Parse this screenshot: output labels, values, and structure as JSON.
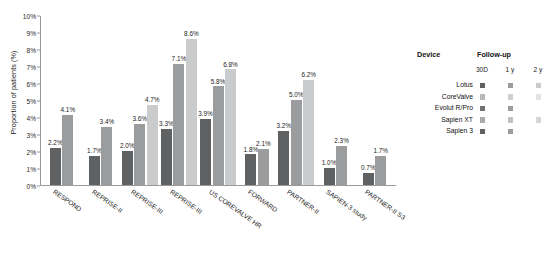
{
  "chart_data": {
    "type": "bar",
    "title": "",
    "xlabel": "",
    "ylabel": "Proportion of patients (%)",
    "ylim": [
      0,
      10
    ],
    "ytick_labels": [
      "0%",
      "1%",
      "2%",
      "3%",
      "4%",
      "5%",
      "6%",
      "7%",
      "8%",
      "9%",
      "10%"
    ],
    "ytick_values": [
      0,
      1,
      2,
      3,
      4,
      5,
      6,
      7,
      8,
      9,
      10
    ],
    "grid": false,
    "legend_position": "right",
    "series": [
      {
        "name": "30D",
        "color": "#5f6163"
      },
      {
        "name": "1 y",
        "color": "#9a9c9e"
      },
      {
        "name": "2 y",
        "color": "#c9cbcd"
      }
    ],
    "categories": [
      "RESPOND",
      "REPRISE-II",
      "REPRISE-III",
      "REPRISE-III",
      "US COREVALVE HR",
      "FORWARD",
      "PARTNER-II",
      "SAPIEN-3 study",
      "PARTNER-II S3"
    ],
    "groups": [
      {
        "category": "RESPOND",
        "bars": [
          {
            "series": "30D",
            "value": 2.2,
            "label": "2.2%"
          },
          {
            "series": "1 y",
            "value": 4.1,
            "label": "4.1%"
          }
        ]
      },
      {
        "category": "REPRISE-II",
        "bars": [
          {
            "series": "30D",
            "value": 1.7,
            "label": "1.7%"
          },
          {
            "series": "1 y",
            "value": 3.4,
            "label": "3.4%"
          }
        ]
      },
      {
        "category": "REPRISE-III",
        "bars": [
          {
            "series": "30D",
            "value": 2.0,
            "label": "2.0%"
          },
          {
            "series": "1 y",
            "value": 3.6,
            "label": "3.6%"
          },
          {
            "series": "2 y",
            "value": 4.7,
            "label": "4.7%"
          }
        ]
      },
      {
        "category": "REPRISE-III",
        "bars": [
          {
            "series": "30D",
            "value": 3.3,
            "label": "3.3%"
          },
          {
            "series": "1 y",
            "value": 7.1,
            "label": "7.1%"
          },
          {
            "series": "2 y",
            "value": 8.6,
            "label": "8.6%"
          }
        ]
      },
      {
        "category": "US COREVALVE HR",
        "bars": [
          {
            "series": "30D",
            "value": 3.9,
            "label": "3.9%"
          },
          {
            "series": "1 y",
            "value": 5.8,
            "label": "5.8%"
          },
          {
            "series": "2 y",
            "value": 6.8,
            "label": "6.8%"
          }
        ]
      },
      {
        "category": "FORWARD",
        "bars": [
          {
            "series": "30D",
            "value": 1.8,
            "label": "1.8%"
          },
          {
            "series": "1 y",
            "value": 2.1,
            "label": "2.1%"
          }
        ]
      },
      {
        "category": "PARTNER-II",
        "bars": [
          {
            "series": "30D",
            "value": 3.2,
            "label": "3.2%"
          },
          {
            "series": "1 y",
            "value": 5.0,
            "label": "5.0%"
          },
          {
            "series": "2 y",
            "value": 6.2,
            "label": "6.2%"
          }
        ]
      },
      {
        "category": "SAPIEN-3 study",
        "bars": [
          {
            "series": "30D",
            "value": 1.0,
            "label": "1.0%"
          },
          {
            "series": "1 y",
            "value": 2.3,
            "label": "2.3%"
          }
        ]
      },
      {
        "category": "PARTNER-II S3",
        "bars": [
          {
            "series": "30D",
            "value": 0.7,
            "label": "0.7%"
          },
          {
            "series": "1 y",
            "value": 1.7,
            "label": "1.7%"
          }
        ]
      }
    ]
  },
  "legend": {
    "device_header": "Device",
    "followup_header": "Follow-up",
    "followup_columns": [
      "30D",
      "1 y",
      "2 y"
    ],
    "rows": [
      {
        "device": "Lotus",
        "swatches": [
          "#5f6163",
          "#9a9c9e",
          "#c9cbcd"
        ]
      },
      {
        "device": "CoreValve",
        "swatches": [
          "#b6b8ba",
          "#cdcfd1",
          "#e0e2e4"
        ]
      },
      {
        "device": "Evolut R/Pro",
        "swatches": [
          "#6f7173",
          "#9a9c9e",
          null
        ]
      },
      {
        "device": "Sapien XT",
        "swatches": [
          "#a8aaac",
          "#bfc1c3",
          "#d4d6d8"
        ]
      },
      {
        "device": "Sapien 3",
        "swatches": [
          "#5f6163",
          "#9a9c9e",
          null
        ]
      }
    ]
  },
  "colors": {
    "series_30d": "#5f6163",
    "series_1y": "#9a9c9e",
    "series_2y": "#c9cbcd",
    "axis": "#9a9a9a",
    "text": "#1d1d1d",
    "background": "#ffffff"
  }
}
